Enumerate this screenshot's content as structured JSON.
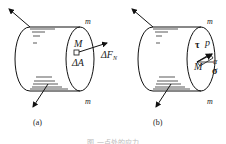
{
  "figure": {
    "panels": [
      {
        "id": "a",
        "sublabel": "(a)",
        "section_label": "m",
        "point_label": "M",
        "area_label": "ΔA",
        "force_label_main": "ΔF",
        "force_label_sub": "N"
      },
      {
        "id": "b",
        "sublabel": "(b)",
        "section_label": "m",
        "point_label": "M",
        "stress_p": "p",
        "stress_tau": "τ",
        "stress_sigma": "σ",
        "angle_alpha": "α"
      }
    ],
    "caption": "图     一点处的应力"
  }
}
